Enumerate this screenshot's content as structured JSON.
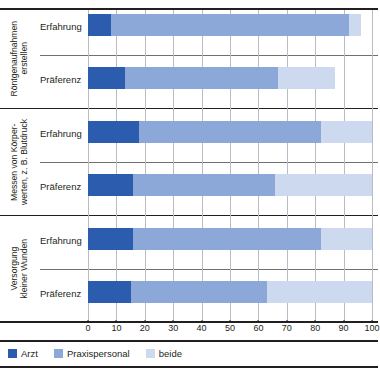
{
  "chart_data": {
    "type": "bar",
    "orientation": "horizontal",
    "stacked": true,
    "title": "",
    "subtitle": "",
    "xlabel": "",
    "ylabel": "",
    "xlim": [
      0,
      100
    ],
    "xticks": [
      0,
      10,
      20,
      30,
      40,
      50,
      60,
      70,
      80,
      90,
      100
    ],
    "grid": true,
    "grid_axis": "x",
    "legend_position": "bottom-left",
    "series": [
      {
        "name": "Arzt",
        "color": "#2b5cad",
        "values": [
          8,
          13,
          18,
          16,
          16,
          15
        ]
      },
      {
        "name": "Praxispersonal",
        "color": "#8ba8d8",
        "values": [
          84,
          54,
          64,
          50,
          66,
          48
        ]
      },
      {
        "name": "beide",
        "color": "#ccd9ee",
        "values": [
          4,
          20,
          18,
          34,
          18,
          37
        ]
      }
    ],
    "categories": [
      "Röntgenaufnahmen erstellen – Erfahrung",
      "Röntgenaufnahmen erstellen – Präferenz",
      "Messen von Körperwerten, z. B. Blutdruck – Erfahrung",
      "Messen von Körperwerten, z. B. Blutdruck – Präferenz",
      "Versorgung kleiner Wunden – Erfahrung",
      "Versorgung kleiner Wunden – Präferenz"
    ],
    "cumulative_ends": [
      {
        "arzt": 8,
        "praxispersonal": 92,
        "beide": 96
      },
      {
        "arzt": 13,
        "praxispersonal": 67,
        "beide": 87
      },
      {
        "arzt": 18,
        "praxispersonal": 82,
        "beide": 100
      },
      {
        "arzt": 16,
        "praxispersonal": 66,
        "beide": 100
      },
      {
        "arzt": 16,
        "praxispersonal": 82,
        "beide": 100
      },
      {
        "arzt": 15,
        "praxispersonal": 63,
        "beide": 100
      }
    ],
    "groups": [
      {
        "label": "Röntgenaufnahmen\nerstellen",
        "rows": [
          {
            "label": "Erfahrung",
            "arzt": 8,
            "praxispersonal": 84,
            "beide": 4
          },
          {
            "label": "Präferenz",
            "arzt": 13,
            "praxispersonal": 54,
            "beide": 20
          }
        ]
      },
      {
        "label": "Messen von Körper-\nwerten, z. B. Blutdruck",
        "rows": [
          {
            "label": "Erfahrung",
            "arzt": 18,
            "praxispersonal": 64,
            "beide": 18
          },
          {
            "label": "Präferenz",
            "arzt": 16,
            "praxispersonal": 50,
            "beide": 34
          }
        ]
      },
      {
        "label": "Versorgung\nkleiner Wunden",
        "rows": [
          {
            "label": "Erfahrung",
            "arzt": 16,
            "praxispersonal": 66,
            "beide": 18
          },
          {
            "label": "Präferenz",
            "arzt": 15,
            "praxispersonal": 48,
            "beide": 37
          }
        ]
      }
    ],
    "legend": [
      {
        "label": "Arzt",
        "color": "#2b5cad"
      },
      {
        "label": "Praxispersonal",
        "color": "#8ba8d8"
      },
      {
        "label": "beide",
        "color": "#ccd9ee"
      }
    ]
  },
  "colors": {
    "arzt": "#2b5cad",
    "praxispersonal": "#8ba8d8",
    "beide": "#ccd9ee",
    "grid": "#b9bcc4",
    "rule": "#231f20"
  },
  "xticks": {
    "t0": "0",
    "t1": "10",
    "t2": "20",
    "t3": "30",
    "t4": "40",
    "t5": "50",
    "t6": "60",
    "t7": "70",
    "t8": "80",
    "t9": "90",
    "t10": "100"
  }
}
